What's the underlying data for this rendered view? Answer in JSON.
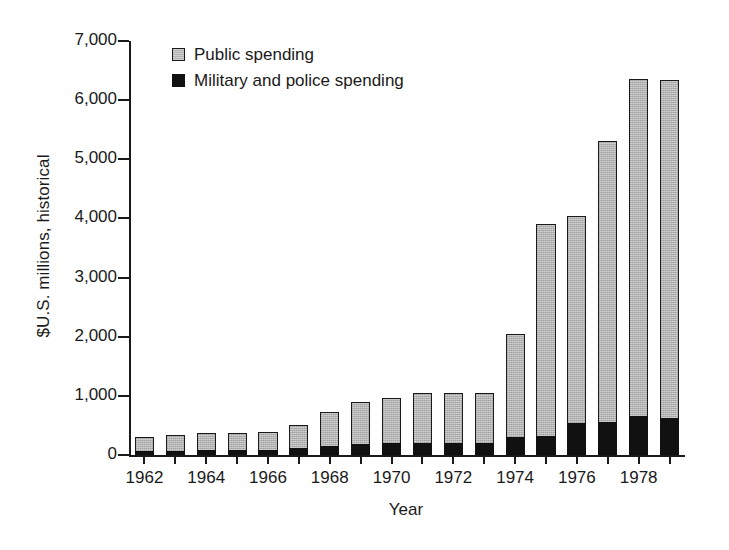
{
  "chart_data": {
    "type": "bar",
    "subtype": "stacked-vertical",
    "title": "",
    "xlabel": "Year",
    "ylabel": "$U.S. millions, historical",
    "ylim": [
      0,
      7000
    ],
    "ytick_labels": [
      "0",
      "1,000",
      "2,000",
      "3,000",
      "4,000",
      "5,000",
      "6,000",
      "7,000"
    ],
    "ytick_values": [
      0,
      1000,
      2000,
      3000,
      4000,
      5000,
      6000,
      7000
    ],
    "grid": false,
    "legend_position": "top-left-inside",
    "categories": [
      "1962",
      "1963",
      "1964",
      "1965",
      "1966",
      "1967",
      "1968",
      "1969",
      "1970",
      "1971",
      "1972",
      "1973",
      "1974",
      "1975",
      "1976",
      "1977",
      "1978",
      "1979"
    ],
    "xtick_labels": [
      "1962",
      "1964",
      "1966",
      "1968",
      "1970",
      "1972",
      "1974",
      "1976",
      "1978"
    ],
    "xtick_categories": [
      "1962",
      "1964",
      "1966",
      "1968",
      "1970",
      "1972",
      "1974",
      "1976",
      "1978"
    ],
    "series": [
      {
        "name": "Military and police spending",
        "color": "#111111",
        "values": [
          60,
          65,
          80,
          80,
          85,
          120,
          150,
          180,
          195,
          200,
          195,
          195,
          310,
          320,
          545,
          550,
          660,
          620
        ]
      },
      {
        "name": "Public spending",
        "color": "#b4b4b4",
        "values": [
          250,
          275,
          300,
          295,
          300,
          390,
          570,
          720,
          775,
          855,
          850,
          850,
          1740,
          3580,
          3490,
          4765,
          5700,
          5720
        ]
      }
    ],
    "totals": [
      310,
      340,
      380,
      375,
      385,
      510,
      720,
      900,
      970,
      1055,
      1045,
      1045,
      2050,
      3900,
      4035,
      5315,
      6360,
      6340
    ]
  },
  "legend": {
    "items": [
      {
        "label": "Public spending",
        "swatch": "public-swatch"
      },
      {
        "label": "Military and police spending",
        "swatch": "military-swatch"
      }
    ]
  }
}
